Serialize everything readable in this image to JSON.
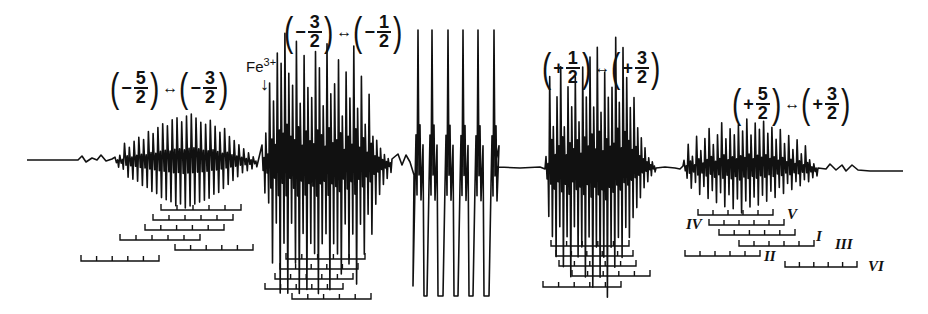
{
  "figure": {
    "type": "EPR spectrum with hyperfine stick diagrams",
    "trace_color": "#111111",
    "baseline": {
      "x_start": 27,
      "y_start": 160,
      "x_end": 903,
      "y_end": 171
    }
  },
  "transitions": [
    {
      "id": "m5-m3",
      "left": {
        "sign": "−",
        "num": "5",
        "den": "2"
      },
      "arrow": "↔",
      "right": {
        "sign": "−",
        "num": "3",
        "den": "2"
      },
      "x": 108,
      "y": 68
    },
    {
      "id": "m3-m1",
      "left": {
        "sign": "−",
        "num": "3",
        "den": "2"
      },
      "arrow": "↔",
      "right": {
        "sign": "−",
        "num": "1",
        "den": "2"
      },
      "x": 282,
      "y": 12
    },
    {
      "id": "p1-p3",
      "left": {
        "sign": "+",
        "num": "1",
        "den": "2"
      },
      "arrow": "↔",
      "right": {
        "sign": "+",
        "num": "3",
        "den": "2"
      },
      "x": 540,
      "y": 48
    },
    {
      "id": "p5-p3",
      "left": {
        "sign": "+",
        "num": "5",
        "den": "2"
      },
      "arrow": "↔",
      "right": {
        "sign": "+",
        "num": "3",
        "den": "2"
      },
      "x": 730,
      "y": 84
    }
  ],
  "impurity_marker": {
    "label": "Fe",
    "superscript": "3+",
    "arrow": "↓",
    "x": 246,
    "y": 56
  },
  "site_labels": [
    {
      "text": "IV",
      "x": 686,
      "y": 216
    },
    {
      "text": "V",
      "x": 787,
      "y": 206
    },
    {
      "text": "I",
      "x": 816,
      "y": 228
    },
    {
      "text": "III",
      "x": 835,
      "y": 236
    },
    {
      "text": "II",
      "x": 764,
      "y": 248
    },
    {
      "text": "VI",
      "x": 868,
      "y": 258
    }
  ],
  "stick_diagrams": [
    {
      "group": "m5-m3",
      "bars": [
        {
          "x1": 161,
          "x2": 241,
          "y": 210,
          "ticks": 6
        },
        {
          "x1": 153,
          "x2": 233,
          "y": 220,
          "ticks": 6
        },
        {
          "x1": 145,
          "x2": 224,
          "y": 230,
          "ticks": 6
        },
        {
          "x1": 120,
          "x2": 200,
          "y": 240,
          "ticks": 6
        },
        {
          "x1": 175,
          "x2": 253,
          "y": 250,
          "ticks": 6
        },
        {
          "x1": 81,
          "x2": 159,
          "y": 261,
          "ticks": 6
        }
      ]
    },
    {
      "group": "m3-m1",
      "bars": [
        {
          "x1": 286,
          "x2": 365,
          "y": 259,
          "ticks": 6
        },
        {
          "x1": 280,
          "x2": 358,
          "y": 269,
          "ticks": 6
        },
        {
          "x1": 275,
          "x2": 353,
          "y": 279,
          "ticks": 6
        },
        {
          "x1": 265,
          "x2": 343,
          "y": 289,
          "ticks": 6
        },
        {
          "x1": 292,
          "x2": 371,
          "y": 299,
          "ticks": 6
        }
      ]
    },
    {
      "group": "p1-p3",
      "bars": [
        {
          "x1": 551,
          "x2": 629,
          "y": 246,
          "ticks": 6
        },
        {
          "x1": 556,
          "x2": 633,
          "y": 256,
          "ticks": 6
        },
        {
          "x1": 559,
          "x2": 636,
          "y": 266,
          "ticks": 6
        },
        {
          "x1": 572,
          "x2": 650,
          "y": 276,
          "ticks": 6
        },
        {
          "x1": 543,
          "x2": 621,
          "y": 287,
          "ticks": 6
        }
      ]
    },
    {
      "group": "p5-p3",
      "bars": [
        {
          "x1": 698,
          "x2": 773,
          "y": 215,
          "ticks": 6
        },
        {
          "x1": 709,
          "x2": 784,
          "y": 225,
          "ticks": 6
        },
        {
          "x1": 719,
          "x2": 795,
          "y": 235,
          "ticks": 6
        },
        {
          "x1": 739,
          "x2": 814,
          "y": 246,
          "ticks": 6
        },
        {
          "x1": 685,
          "x2": 760,
          "y": 256,
          "ticks": 6
        },
        {
          "x1": 785,
          "x2": 857,
          "y": 267,
          "ticks": 6
        }
      ]
    }
  ],
  "spectrum": {
    "segments": [
      {
        "name": "wing-left",
        "x": [
          27,
          78,
          82,
          86,
          92,
          97,
          101,
          106,
          112
        ],
        "y": [
          160,
          160,
          156,
          162,
          158,
          160,
          155,
          161,
          159
        ]
      },
      {
        "name": "group-m5-m3",
        "x0": 115,
        "x1": 258,
        "n": 30,
        "amp_up": [
          4,
          6,
          18,
          14,
          20,
          24,
          22,
          30,
          28,
          34,
          38,
          36,
          42,
          44,
          40,
          46,
          48,
          44,
          40,
          38,
          42,
          36,
          30,
          34,
          26,
          22,
          18,
          14,
          10,
          6
        ],
        "amp_down": [
          6,
          8,
          16,
          18,
          20,
          24,
          26,
          30,
          32,
          36,
          38,
          40,
          44,
          42,
          46,
          44,
          42,
          40,
          38,
          36,
          32,
          30,
          26,
          22,
          18,
          14,
          10,
          8,
          6,
          4
        ]
      },
      {
        "name": "group-m3-m1",
        "x0": 262,
        "x1": 392,
        "n": 34,
        "amp_up": [
          18,
          30,
          80,
          62,
          110,
          100,
          130,
          90,
          78,
          122,
          60,
          108,
          76,
          66,
          112,
          96,
          58,
          120,
          70,
          80,
          104,
          48,
          92,
          66,
          118,
          56,
          88,
          40,
          70,
          28,
          24,
          16,
          10,
          6
        ],
        "amp_down": [
          30,
          40,
          100,
          60,
          130,
          80,
          130,
          60,
          100,
          130,
          70,
          126,
          80,
          90,
          130,
          80,
          70,
          126,
          80,
          90,
          110,
          60,
          100,
          70,
          120,
          60,
          90,
          50,
          70,
          40,
          30,
          20,
          14,
          8
        ]
      },
      {
        "name": "dip-before-center",
        "x": [
          392,
          398,
          402,
          406,
          410,
          414
        ],
        "y": [
          159,
          154,
          165,
          155,
          162,
          175
        ]
      },
      {
        "name": "center-sextet",
        "peaks_x": [
          418,
          432,
          448,
          463,
          478,
          494
        ],
        "top_y": 30,
        "bottom_y": 296
      },
      {
        "name": "flat-middle",
        "x": [
          498,
          520,
          540,
          545
        ],
        "y": [
          167,
          168,
          167,
          169
        ]
      },
      {
        "name": "group-p1-p3",
        "x0": 546,
        "x1": 656,
        "n": 30,
        "amp_up": [
          10,
          90,
          40,
          70,
          100,
          40,
          80,
          60,
          90,
          45,
          100,
          70,
          110,
          60,
          120,
          55,
          95,
          70,
          80,
          130,
          65,
          120,
          90,
          60,
          70,
          40,
          30,
          20,
          10,
          6
        ],
        "amp_down": [
          50,
          70,
          90,
          60,
          100,
          70,
          110,
          60,
          90,
          80,
          110,
          70,
          120,
          80,
          110,
          90,
          130,
          80,
          100,
          70,
          90,
          60,
          70,
          50,
          40,
          30,
          20,
          14,
          8,
          4
        ]
      },
      {
        "name": "wing-mid",
        "x": [
          656,
          665,
          675,
          680,
          683
        ],
        "y": [
          168,
          167,
          168,
          169,
          166
        ]
      },
      {
        "name": "group-p5-p3",
        "x0": 684,
        "x1": 818,
        "n": 32,
        "amp_up": [
          8,
          24,
          12,
          32,
          18,
          30,
          40,
          24,
          34,
          46,
          30,
          40,
          34,
          44,
          38,
          50,
          34,
          46,
          40,
          48,
          36,
          42,
          30,
          40,
          26,
          34,
          20,
          30,
          16,
          24,
          10,
          6
        ],
        "amp_down": [
          10,
          20,
          14,
          26,
          18,
          30,
          22,
          34,
          24,
          38,
          26,
          40,
          30,
          44,
          32,
          38,
          28,
          36,
          26,
          32,
          22,
          28,
          18,
          24,
          14,
          20,
          12,
          16,
          10,
          12,
          8,
          6
        ]
      },
      {
        "name": "wing-right",
        "x": [
          818,
          826,
          830,
          836,
          842,
          846,
          852,
          858,
          870,
          903
        ],
        "y": [
          168,
          169,
          164,
          170,
          165,
          171,
          165,
          170,
          171,
          171
        ]
      }
    ]
  }
}
